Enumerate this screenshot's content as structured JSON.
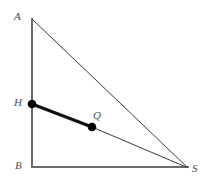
{
  "figure": {
    "background_color": "#ffffff",
    "width": 210,
    "height": 186,
    "stroke_color_thick": "#555555",
    "stroke_color_thin": "#333333",
    "point_color": "#000000",
    "label_color": "#4a4a4a"
  },
  "vertices": [
    {
      "id": "A",
      "label": "A",
      "x": 32,
      "y": 19,
      "label_x": 14,
      "label_y": 11,
      "kind": "triangle-apex"
    },
    {
      "id": "B",
      "label": "B",
      "x": 32,
      "y": 167,
      "label_x": 15,
      "label_y": 160,
      "kind": "right-angle-corner"
    },
    {
      "id": "S",
      "label": "S",
      "x": 186,
      "y": 167,
      "label_x": 192,
      "label_y": 163,
      "kind": "triangle-vertex"
    }
  ],
  "points": [
    {
      "id": "H",
      "label": "H",
      "x": 32,
      "y": 104,
      "radius": 4.3,
      "label_x": 14,
      "label_y": 97,
      "on": "AB"
    },
    {
      "id": "Q",
      "label": "Q",
      "x": 92,
      "y": 127,
      "radius": 4.3,
      "label_x": 93,
      "label_y": 110,
      "on": "HS"
    }
  ],
  "segments": [
    {
      "id": "AB",
      "from": "A",
      "to": "B",
      "x1": 32,
      "y1": 19,
      "x2": 32,
      "y2": 167,
      "width": 2.0,
      "color": "#6a6a6a",
      "style": "solid"
    },
    {
      "id": "BS",
      "from": "B",
      "to": "S",
      "x1": 32,
      "y1": 167,
      "x2": 188,
      "y2": 167,
      "width": 2.0,
      "color": "#6a6a6a",
      "style": "solid"
    },
    {
      "id": "AS",
      "from": "A",
      "to": "S",
      "x1": 32,
      "y1": 19,
      "x2": 187,
      "y2": 167,
      "width": 1.0,
      "color": "#3a3a3a",
      "style": "solid"
    },
    {
      "id": "QS",
      "from": "Q",
      "to": "S",
      "x1": 92,
      "y1": 127,
      "x2": 186,
      "y2": 167,
      "width": 1.0,
      "color": "#3a3a3a",
      "style": "solid"
    },
    {
      "id": "HQ",
      "from": "H",
      "to": "Q",
      "x1": 32,
      "y1": 104,
      "x2": 92,
      "y2": 127,
      "width": 3.0,
      "color": "#111111",
      "style": "solid-emphasis"
    }
  ],
  "labels": {
    "A": "A",
    "B": "B",
    "S": "S",
    "H": "H",
    "Q": "Q"
  }
}
